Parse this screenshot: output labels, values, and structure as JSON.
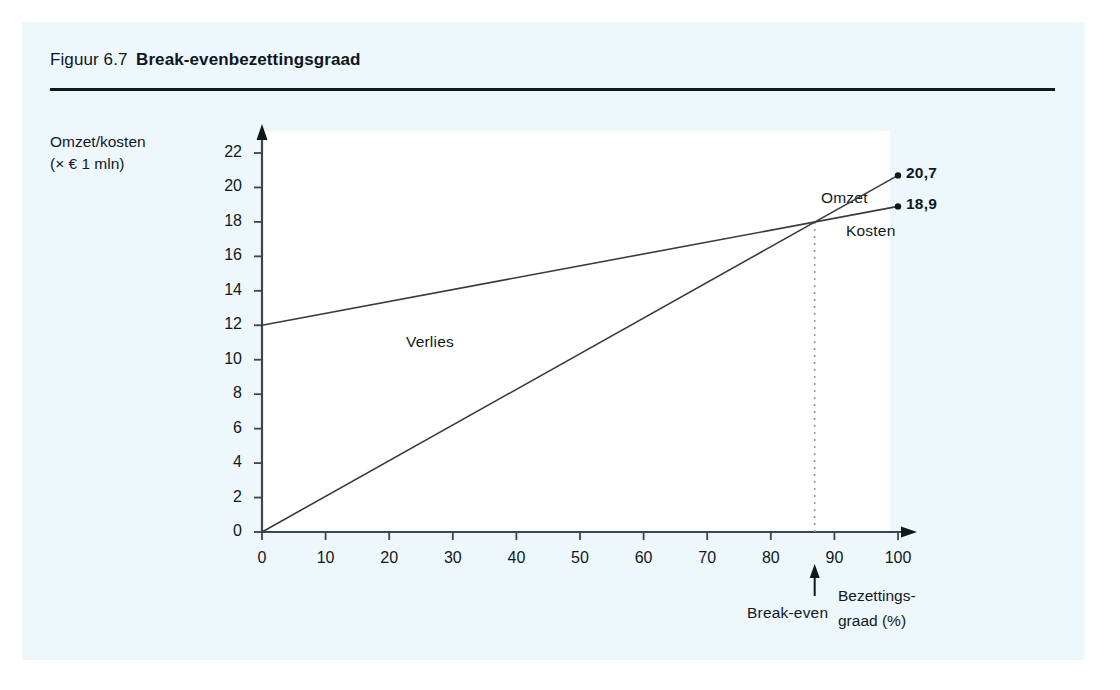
{
  "figure": {
    "number": "Figuur 6.7",
    "name": "Break-evenbezettingsgraad"
  },
  "chart_data": {
    "type": "line",
    "title": "Break-evenbezettingsgraad",
    "xlabel": "Bezettingsgraad (%)",
    "xlabel_line1": "Bezettings-",
    "xlabel_line2": "graad (%)",
    "ylabel": "Omzet/kosten (× € 1 mln)",
    "ylabel_line1": "Omzet/kosten",
    "ylabel_line2": "(× € 1 mln)",
    "xlim": [
      0,
      100
    ],
    "ylim": [
      0,
      22
    ],
    "xticks": [
      "0",
      "10",
      "20",
      "30",
      "40",
      "50",
      "60",
      "70",
      "80",
      "90",
      "100"
    ],
    "yticks": [
      "0",
      "2",
      "4",
      "6",
      "8",
      "10",
      "12",
      "14",
      "16",
      "18",
      "20",
      "22"
    ],
    "grid": false,
    "legend": "inline-labels",
    "series": [
      {
        "name": "Omzet",
        "x": [
          0,
          100
        ],
        "values": [
          0,
          20.7
        ],
        "endpoint_label": "20,7",
        "color": "#3b3b3b"
      },
      {
        "name": "Kosten",
        "x": [
          0,
          100
        ],
        "values": [
          12,
          18.9
        ],
        "endpoint_label": "18,9",
        "color": "#3b3b3b"
      }
    ],
    "annotations": [
      {
        "name": "Verlies",
        "text": "Verlies",
        "x": 23,
        "y": 10.7
      },
      {
        "name": "Break-even",
        "text": "Break-even",
        "x": 86.9,
        "y": 18.0,
        "marker": "dashed-vertical-line"
      }
    ],
    "break_even": {
      "label": "Break-even",
      "x": 86.9,
      "y": 18.0
    }
  }
}
